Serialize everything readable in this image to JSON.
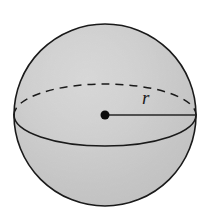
{
  "figure": {
    "name": "sphere-with-radius",
    "caption": "",
    "background_color": "#ffffff",
    "width": 201,
    "height": 213
  },
  "sphere": {
    "center_x": 105,
    "center_y": 115,
    "radius": 91,
    "fill_color": "#c9c9c9",
    "highlight_color": "#e8e8e8",
    "outline_color": "#1a1a1a",
    "outline_width": 1.6
  },
  "equator": {
    "center_x": 105,
    "center_y": 115,
    "semi_major_axis": 91,
    "semi_minor_axis": 31,
    "front_arc_style": "solid",
    "back_arc_style": "dashed",
    "dash_pattern": "8 6",
    "stroke_color": "#1a1a1a",
    "stroke_width": 1.5
  },
  "center_point": {
    "x": 105,
    "y": 115,
    "diameter": 9,
    "color": "#0d0d0d"
  },
  "radius_segment": {
    "x1": 105,
    "y1": 115,
    "x2": 196,
    "y2": 115,
    "stroke_color": "#262626",
    "stroke_width": 1.6
  },
  "labels": {
    "radius": "r"
  }
}
